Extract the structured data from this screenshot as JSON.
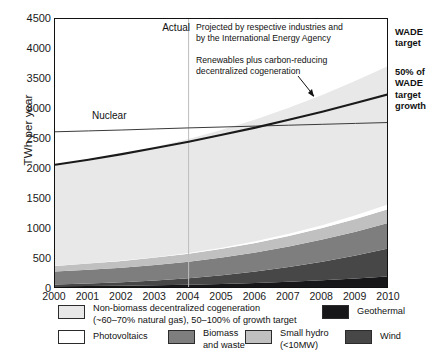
{
  "axes": {
    "ylabel": "TWh per year",
    "yticks": [
      "0",
      "500",
      "1000",
      "1500",
      "2000",
      "2500",
      "3000",
      "3500",
      "4000",
      "4500"
    ],
    "ytick_values": [
      0,
      500,
      1000,
      1500,
      2000,
      2500,
      3000,
      3500,
      4000,
      4500
    ],
    "xticks": [
      "2000",
      "2001",
      "2002",
      "2003",
      "2004",
      "2005",
      "2006",
      "2007",
      "2008",
      "2009",
      "2010"
    ]
  },
  "annotations": {
    "actual": "Actual",
    "projected": "Projected by respective industries and by the International Energy Agency",
    "projected_line1": "Projected by respective industries and",
    "projected_line2": "by the International Energy Agency",
    "renewables": "Renewables plus carbon-reducing decentralized cogeneration",
    "renewables_line1": "Renewables plus carbon-reducing",
    "renewables_line2": "decentralized cogeneration",
    "nuclear": "Nuclear",
    "divider_year": "2004"
  },
  "side_labels": {
    "wade_target_line1": "WADE",
    "wade_target_line2": "target",
    "wade_growth_line1": "50% of",
    "wade_growth_line2": "WADE",
    "wade_growth_line3": "target",
    "wade_growth_line4": "growth"
  },
  "legend": {
    "items": [
      {
        "name": "non-biomass-cogeneration",
        "label_line1": "Non-biomass decentralized cogeneration",
        "label_line2": "(~60–70% natural gas), 50–100% of growth target",
        "color": "#e8e8e8"
      },
      {
        "name": "geothermal",
        "label_line1": "Geothermal",
        "label_line2": "",
        "color": "#17171a"
      },
      {
        "name": "photovoltaics",
        "label_line1": "Photovoltaics",
        "label_line2": "",
        "color": "#ffffff"
      },
      {
        "name": "biomass-and-waste",
        "label_line1": "Biomass",
        "label_line2": "and waste",
        "color": "#7e7e7e"
      },
      {
        "name": "small-hydro",
        "label_line1": "Small hydro",
        "label_line2": "(<10MW)",
        "color": "#c0c0c0"
      },
      {
        "name": "wind",
        "label_line1": "Wind",
        "label_line2": "",
        "color": "#474747"
      }
    ]
  },
  "colors": {
    "cogeneration": "#e8e8e8",
    "photovoltaics": "#ffffff",
    "small_hydro": "#c0c0c0",
    "biomass": "#7e7e7e",
    "wind": "#474747",
    "geothermal": "#17171a",
    "line_dark": "#1a1a1a",
    "line_nuclear": "#3a3a3a",
    "divider": "#bdbdbd",
    "frame": "#111111"
  },
  "chart_data": {
    "type": "area",
    "title": "",
    "xlabel": "",
    "ylabel": "TWh per year",
    "x": [
      2000,
      2001,
      2002,
      2003,
      2004,
      2005,
      2006,
      2007,
      2008,
      2009,
      2010
    ],
    "ylim": [
      0,
      4500
    ],
    "xlim": [
      2000,
      2010
    ],
    "grid": false,
    "legend_position": "below",
    "stacked_series": [
      {
        "name": "Geothermal",
        "values": [
          45,
          50,
          56,
          63,
          72,
          84,
          100,
          120,
          145,
          175,
          210
        ]
      },
      {
        "name": "Wind",
        "values": [
          30,
          42,
          58,
          80,
          108,
          145,
          190,
          245,
          310,
          385,
          470
        ]
      },
      {
        "name": "Biomass and waste",
        "values": [
          215,
          228,
          242,
          258,
          276,
          296,
          318,
          342,
          368,
          396,
          425
        ]
      },
      {
        "name": "Small hydro (<10MW)",
        "values": [
          95,
          103,
          112,
          122,
          133,
          146,
          160,
          176,
          193,
          212,
          232
        ]
      },
      {
        "name": "Photovoltaics",
        "values": [
          2,
          3,
          5,
          8,
          12,
          18,
          26,
          36,
          48,
          62,
          78
        ]
      },
      {
        "name": "Non-biomass decentralized cogeneration",
        "values": [
          1680,
          1730,
          1780,
          1840,
          1900,
          1965,
          2030,
          2100,
          2170,
          2240,
          2310
        ]
      }
    ],
    "lines": [
      {
        "name": "Nuclear",
        "values": [
          2620,
          2635,
          2650,
          2668,
          2685,
          2700,
          2715,
          2730,
          2745,
          2760,
          2775
        ],
        "style": "thin"
      },
      {
        "name": "Renewables plus carbon-reducing decentralized cogeneration",
        "values": [
          2070,
          2155,
          2248,
          2350,
          2455,
          2570,
          2690,
          2820,
          2955,
          3100,
          3250
        ],
        "style": "thick"
      }
    ],
    "total_band_top": [
      2067,
      2156,
      2253,
      2371,
      2501,
      2654,
      2824,
      3019,
      3234,
      3470,
      3725
    ]
  }
}
